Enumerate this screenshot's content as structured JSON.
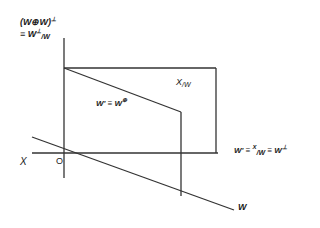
{
  "diagram": {
    "colors": {
      "line": "#333333",
      "text": "#1a1a1a",
      "background": "#ffffff"
    },
    "labels": {
      "y_axis_line1": "(W⊕W)",
      "y_axis_line1_sup": "⊥",
      "y_axis_line2_prefix": "≡ W",
      "y_axis_line2_sup": "⊥",
      "y_axis_line2_sub": "/W",
      "x_axis_left": "X",
      "origin": "O",
      "x_axis_right_prefix": "W' ≡ ",
      "x_axis_right_frac_num": "X",
      "x_axis_right_frac_den": "/W",
      "x_axis_right_suffix": " ≡ W",
      "x_axis_right_suffix_sup": "⊥",
      "quotient_region": "X",
      "quotient_region_sub": "/W",
      "inner_region": "W' ≡ W",
      "inner_region_sup": "⊕",
      "w_line": "W"
    },
    "geometry": {
      "vertical_axis": {
        "x": 64,
        "y1": 38,
        "y2": 178
      },
      "horizontal_axis": {
        "y": 153,
        "x1": 32,
        "x2": 218
      },
      "rect_top": {
        "y": 68,
        "x1": 64,
        "x2": 216
      },
      "rect_right": {
        "x": 216,
        "y1": 68,
        "y2": 153
      },
      "diagonal": {
        "x1": 64,
        "y1": 68,
        "x2": 181,
        "y2": 112
      },
      "inner_vertical": {
        "x": 181,
        "y1": 112,
        "y2": 196
      },
      "w_line": {
        "x1": 32,
        "y1": 137,
        "x2": 234,
        "y2": 210
      }
    }
  }
}
